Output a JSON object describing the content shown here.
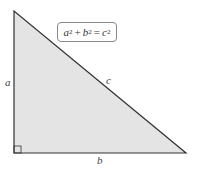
{
  "diagram": {
    "formula": {
      "a": "a",
      "a_exp": "2",
      "plus": "+",
      "b": "b",
      "b_exp": "2",
      "equals": "=",
      "c": "c",
      "c_exp": "2"
    },
    "labels": {
      "side_a": "a",
      "side_b": "b",
      "side_c": "c"
    },
    "colors": {
      "fill": "#e4e4e4",
      "stroke": "#333333"
    }
  }
}
